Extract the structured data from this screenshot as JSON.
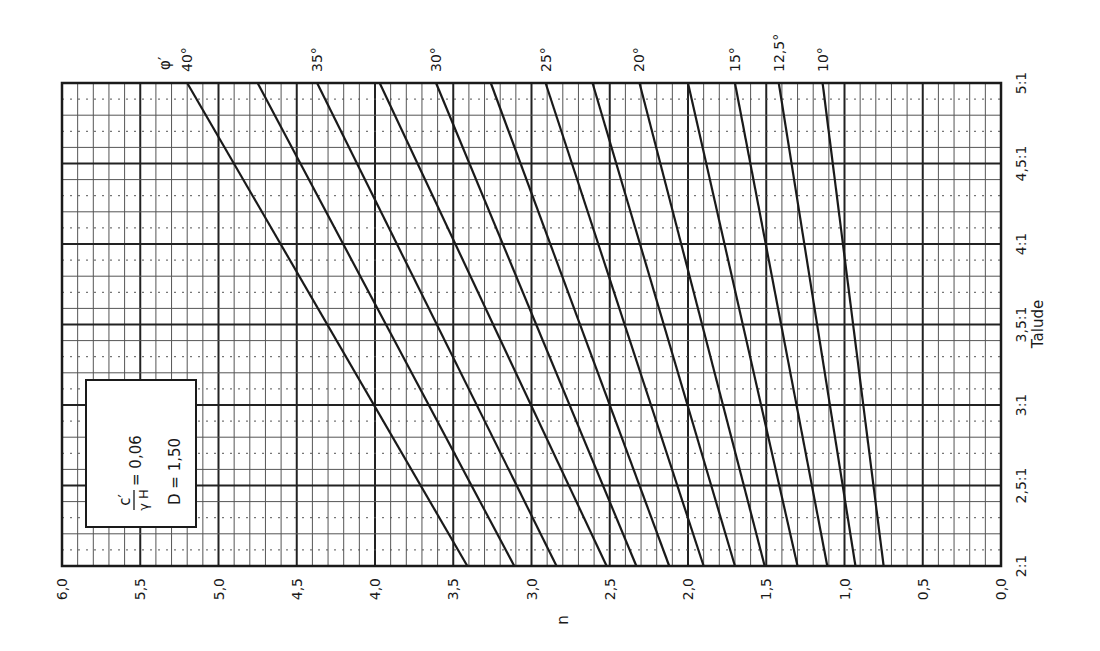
{
  "chart_data": {
    "type": "line",
    "orientation": "rotated-90-clockwise",
    "title": "",
    "xlabel": "n",
    "ylabel": "Talude",
    "legend_title": "φ′",
    "annotation": {
      "numerator": "c′",
      "denominator": "γ H",
      "ratio_value": "= 0,06",
      "depth_label": "D = 1,50"
    },
    "n_ticks": [
      "6,0",
      "5,5",
      "5,0",
      "4,5",
      "4,0",
      "3,5",
      "3,0",
      "2,5",
      "2,0",
      "1,5",
      "1,0",
      "0,5",
      "0,0"
    ],
    "n_tick_values": [
      6.0,
      5.5,
      5.0,
      4.5,
      4.0,
      3.5,
      3.0,
      2.5,
      2.0,
      1.5,
      1.0,
      0.5,
      0.0
    ],
    "talude_ticks": [
      "2:1",
      "2,5:1",
      "3:1",
      "3,5:1",
      "4:1",
      "4,5:1",
      "5:1"
    ],
    "talude_tick_values": [
      2.0,
      2.5,
      3.0,
      3.5,
      4.0,
      4.5,
      5.0
    ],
    "nlim": [
      0,
      6
    ],
    "talude_lim": [
      2,
      5
    ],
    "grid": true,
    "phi_labels": [
      {
        "label": "40°",
        "phi": 40
      },
      {
        "label": "35°",
        "phi": 35
      },
      {
        "label": "30°",
        "phi": 30
      },
      {
        "label": "25°",
        "phi": 25
      },
      {
        "label": "20°",
        "phi": 20
      },
      {
        "label": "15°",
        "phi": 15
      },
      {
        "label": "12,5°",
        "phi": 12.5
      },
      {
        "label": "10°",
        "phi": 10
      }
    ],
    "series": [
      {
        "name": "φ′ = 40°",
        "talude": [
          2,
          5
        ],
        "n": [
          3.41,
          5.2
        ]
      },
      {
        "name": "φ′ = 37,5°",
        "talude": [
          2,
          5
        ],
        "n": [
          3.11,
          4.75
        ]
      },
      {
        "name": "φ′ = 35°",
        "talude": [
          2,
          5
        ],
        "n": [
          2.84,
          4.37
        ]
      },
      {
        "name": "φ′ = 32,5°",
        "talude": [
          2,
          5
        ],
        "n": [
          2.52,
          3.97
        ]
      },
      {
        "name": "φ′ = 30°",
        "talude": [
          2,
          5
        ],
        "n": [
          2.33,
          3.61
        ]
      },
      {
        "name": "φ′ = 27,5°",
        "talude": [
          2,
          5
        ],
        "n": [
          2.12,
          3.26
        ]
      },
      {
        "name": "φ′ = 25°",
        "talude": [
          2,
          5
        ],
        "n": [
          1.9,
          2.91
        ]
      },
      {
        "name": "φ′ = 22,5°",
        "talude": [
          2,
          5
        ],
        "n": [
          1.7,
          2.61
        ]
      },
      {
        "name": "φ′ = 20°",
        "talude": [
          2,
          5
        ],
        "n": [
          1.51,
          2.31
        ]
      },
      {
        "name": "φ′ = 17,5°",
        "talude": [
          2,
          5
        ],
        "n": [
          1.3,
          2.0
        ]
      },
      {
        "name": "φ′ = 15°",
        "talude": [
          2,
          5
        ],
        "n": [
          1.11,
          1.7
        ]
      },
      {
        "name": "φ′ = 12,5°",
        "talude": [
          2,
          5
        ],
        "n": [
          0.93,
          1.42
        ]
      },
      {
        "name": "φ′ = 10°",
        "talude": [
          2,
          5
        ],
        "n": [
          0.75,
          1.14
        ]
      }
    ],
    "phi_label_series_index": [
      0,
      2,
      4,
      6,
      8,
      10,
      11,
      12
    ]
  },
  "colors": {
    "line": "#1a1a1a",
    "grid_major": "#222222",
    "grid_minor": "#555555",
    "background": "#ffffff"
  }
}
